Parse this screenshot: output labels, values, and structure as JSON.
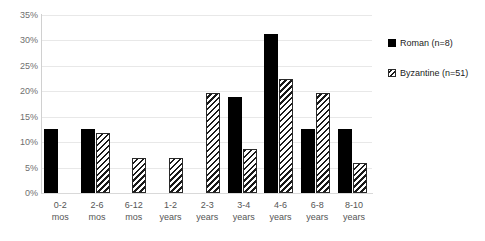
{
  "chart_data": {
    "type": "bar",
    "title": "",
    "xlabel": "",
    "ylabel": "",
    "ylim": [
      0,
      35
    ],
    "ytick_values": [
      35,
      30,
      25,
      20,
      15,
      10,
      5,
      0
    ],
    "ytick_labels": [
      "35%",
      "30%",
      "25%",
      "20%",
      "15%",
      "10%",
      "5%",
      "0%"
    ],
    "grid": true,
    "legend_position": "right",
    "categories": [
      "0-2 mos",
      "2-6 mos",
      "6-12 mos",
      "1-2 years",
      "2-3 years",
      "3-4 years",
      "4-6 years",
      "6-8 years",
      "8-10 years"
    ],
    "category_lines": [
      [
        "0-2",
        "mos"
      ],
      [
        "2-6",
        "mos"
      ],
      [
        "6-12",
        "mos"
      ],
      [
        "1-2",
        "years"
      ],
      [
        "2-3",
        "years"
      ],
      [
        "3-4",
        "years"
      ],
      [
        "4-6",
        "years"
      ],
      [
        "6-8",
        "years"
      ],
      [
        "8-10",
        "years"
      ]
    ],
    "series": [
      {
        "name": "Roman (n=8)",
        "swatch": "solid-black-square",
        "color": "#000000",
        "values": [
          12.5,
          12.5,
          0,
          0,
          0,
          18.8,
          31.3,
          12.5,
          12.5
        ]
      },
      {
        "name": "Byzantine (n=51)",
        "swatch": "diagonal-hatch-square",
        "color": "#ffffff",
        "values": [
          0,
          11.8,
          6.9,
          6.9,
          19.6,
          8.6,
          22.4,
          19.6,
          5.9
        ]
      }
    ]
  },
  "legend": {
    "items": [
      {
        "label": "Roman (n=8)"
      },
      {
        "label": "Byzantine (n=51)"
      }
    ]
  }
}
